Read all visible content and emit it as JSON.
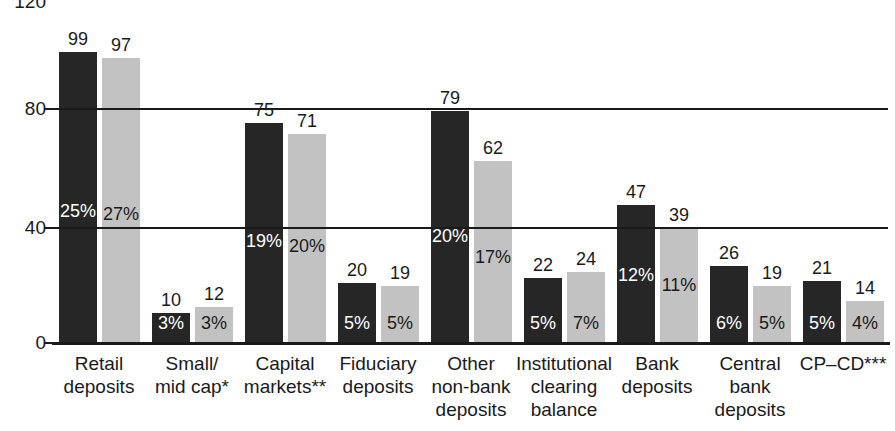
{
  "chart_data": {
    "type": "bar",
    "title": "",
    "subtitle": "",
    "xlabel": "",
    "ylabel": "",
    "ylim": [
      0,
      120
    ],
    "yticks": [
      0,
      40,
      80,
      120
    ],
    "ytick_labels": [
      "0",
      "40",
      "80",
      "120"
    ],
    "grid": true,
    "legend_position": "none",
    "orientation": "vertical",
    "categories": [
      "Retail\ndeposits",
      "Small/\nmid cap*",
      "Capital\nmarkets**",
      "Fiduciary\ndeposits",
      "Other\nnon-bank\ndeposits",
      "Institutional\nclearing\nbalance",
      "Bank\ndeposits",
      "Central\nbank\ndeposits",
      "CP–CD***"
    ],
    "category_lines": [
      [
        "Retail",
        "deposits"
      ],
      [
        "Small/",
        "mid cap*"
      ],
      [
        "Capital",
        "markets**"
      ],
      [
        "Fiduciary",
        "deposits"
      ],
      [
        "Other",
        "non-bank",
        "deposits"
      ],
      [
        "Institutional",
        "clearing",
        "balance"
      ],
      [
        "Bank",
        "deposits"
      ],
      [
        "Central",
        "bank",
        "deposits"
      ],
      [
        "CP–CD***"
      ]
    ],
    "series": [
      {
        "name": "series-dark",
        "color": "#262626",
        "values": [
          99,
          10,
          75,
          20,
          79,
          22,
          47,
          26,
          21
        ],
        "value_labels": [
          "99",
          "10",
          "75",
          "20",
          "79",
          "22",
          "47",
          "26",
          "21"
        ],
        "share_labels": [
          "25%",
          "27%",
          "19%",
          "5%",
          "20%",
          "5%",
          "12%",
          "6%",
          "5%"
        ]
      },
      {
        "name": "series-light",
        "color": "#c2c2c2",
        "values": [
          97,
          12,
          71,
          19,
          62,
          24,
          39,
          19,
          14
        ],
        "value_labels": [
          "97",
          "12",
          "71",
          "19",
          "62",
          "24",
          "39",
          "19",
          "14"
        ],
        "share_labels": [
          "27%",
          "3%",
          "20%",
          "5%",
          "17%",
          "7%",
          "11%",
          "5%",
          "4%"
        ]
      }
    ],
    "dark_share_labels": [
      "25%",
      "3%",
      "19%",
      "5%",
      "20%",
      "5%",
      "12%",
      "6%",
      "5%"
    ],
    "light_share_labels": [
      "27%",
      "3%",
      "20%",
      "5%",
      "17%",
      "7%",
      "11%",
      "5%",
      "4%"
    ]
  },
  "colors": {
    "dark_bar": "#262626",
    "light_bar": "#c2c2c2",
    "axis": "#1a1a1a",
    "background": "#ffffff",
    "dark_bar_text": "#ffffff",
    "light_bar_text": "#1a1a1a"
  },
  "axis": {
    "y_tick_0": "0",
    "y_tick_40": "40",
    "y_tick_80": "80",
    "y_tick_120": "120"
  },
  "groups": [
    {
      "label_lines": [
        "Retail",
        "deposits"
      ],
      "dark": {
        "value": "99",
        "pct": "25%"
      },
      "light": {
        "value": "97",
        "pct": "27%"
      }
    },
    {
      "label_lines": [
        "Small/",
        "mid cap*"
      ],
      "dark": {
        "value": "10",
        "pct": "3%"
      },
      "light": {
        "value": "12",
        "pct": "3%"
      }
    },
    {
      "label_lines": [
        "Capital",
        "markets**"
      ],
      "dark": {
        "value": "75",
        "pct": "19%"
      },
      "light": {
        "value": "71",
        "pct": "20%"
      }
    },
    {
      "label_lines": [
        "Fiduciary",
        "deposits"
      ],
      "dark": {
        "value": "20",
        "pct": "5%"
      },
      "light": {
        "value": "19",
        "pct": "5%"
      }
    },
    {
      "label_lines": [
        "Other",
        "non-bank",
        "deposits"
      ],
      "dark": {
        "value": "79",
        "pct": "20%"
      },
      "light": {
        "value": "62",
        "pct": "17%"
      }
    },
    {
      "label_lines": [
        "Institutional",
        "clearing",
        "balance"
      ],
      "dark": {
        "value": "22",
        "pct": "5%"
      },
      "light": {
        "value": "24",
        "pct": "7%"
      }
    },
    {
      "label_lines": [
        "Bank",
        "deposits"
      ],
      "dark": {
        "value": "47",
        "pct": "12%"
      },
      "light": {
        "value": "39",
        "pct": "11%"
      }
    },
    {
      "label_lines": [
        "Central",
        "bank",
        "deposits"
      ],
      "dark": {
        "value": "26",
        "pct": "6%"
      },
      "light": {
        "value": "19",
        "pct": "5%"
      }
    },
    {
      "label_lines": [
        "CP–CD***"
      ],
      "dark": {
        "value": "21",
        "pct": "5%"
      },
      "light": {
        "value": "14",
        "pct": "4%"
      }
    }
  ]
}
